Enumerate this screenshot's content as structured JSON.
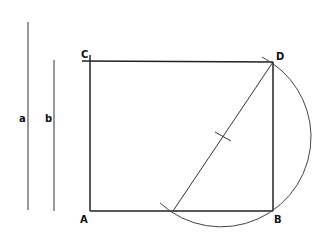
{
  "diagram": {
    "type": "geometric-construction",
    "segments": {
      "a": {
        "label": "a"
      },
      "b": {
        "label": "b"
      }
    },
    "rectangle": {
      "vertices": {
        "A": "A",
        "B": "B",
        "C": "C",
        "D": "D"
      }
    },
    "colors": {
      "stroke": "#222222",
      "background": "#ffffff"
    }
  }
}
